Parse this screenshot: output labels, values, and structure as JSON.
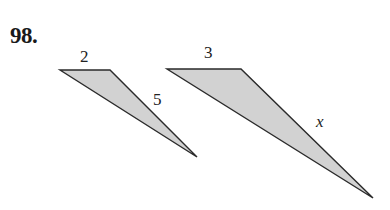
{
  "problem": {
    "number": "98.",
    "figures": [
      {
        "name": "small-triangle",
        "labels": {
          "top_side": "2",
          "right_side": "5"
        },
        "points": "60,70 110,70 197,157"
      },
      {
        "name": "large-triangle",
        "labels": {
          "top_side": "3",
          "right_side": "x"
        },
        "points": "167,69 241,69 373,198"
      }
    ],
    "fill_color": "#d2d2d2",
    "stroke_color": "#2a2a2a"
  }
}
